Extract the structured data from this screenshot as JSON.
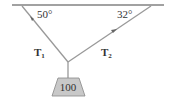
{
  "diagram": {
    "angles": {
      "left": "50°",
      "right": "32°"
    },
    "tensions": {
      "left": {
        "symbol": "T",
        "subscript": "1"
      },
      "right": {
        "symbol": "T",
        "subscript": "2"
      }
    },
    "weight": {
      "label": "100"
    },
    "colors": {
      "line": "#333333",
      "rope": "#888888",
      "weight_fill": "#c8c8c8",
      "weight_stroke": "#777777"
    }
  }
}
